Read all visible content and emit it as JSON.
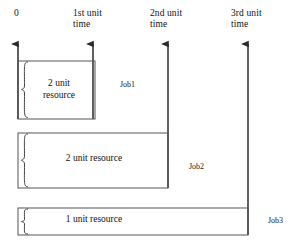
{
  "diagram": {
    "type": "timeline-gantt",
    "stroke_color": "#2b2b2b",
    "background": "#ffffff",
    "axis": {
      "ticks": [
        {
          "id": "t0",
          "label": "0",
          "x": 18
        },
        {
          "id": "t1",
          "label": "1st  unit\ntime",
          "x": 93
        },
        {
          "id": "t2",
          "label": "2nd unit\ntime",
          "x": 168
        },
        {
          "id": "t3",
          "label": "3rd  unit\ntime",
          "x": 248
        }
      ]
    },
    "jobs": [
      {
        "id": "job1",
        "name": "Job1",
        "resource_text": "2 unit\nresource",
        "resource_units": 2,
        "start_tick": "t0",
        "end_tick": "t1",
        "box": {
          "x": 18,
          "y": 61,
          "w": 77,
          "h": 58
        },
        "label_pos": {
          "x": 120,
          "y": 80
        },
        "brace": true
      },
      {
        "id": "job2",
        "name": "Job2",
        "resource_text": "2 unit resource",
        "resource_units": 2,
        "start_tick": "t0",
        "end_tick": "t2",
        "box": {
          "x": 18,
          "y": 133,
          "w": 150,
          "h": 55
        },
        "label_pos": {
          "x": 189,
          "y": 162
        },
        "brace": true
      },
      {
        "id": "job3",
        "name": "Job3",
        "resource_text": "1 unit resource",
        "resource_units": 1,
        "start_tick": "t0",
        "end_tick": "t3",
        "box": {
          "x": 18,
          "y": 208,
          "w": 230,
          "h": 27
        },
        "label_pos": {
          "x": 268,
          "y": 216
        },
        "brace": true
      }
    ]
  }
}
